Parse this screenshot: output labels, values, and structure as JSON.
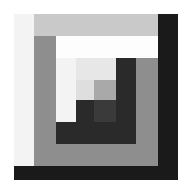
{
  "image": {
    "title": "Log Cabin Quilt Block",
    "type": "geometric-pattern",
    "canvas_width": 192,
    "canvas_height": 194,
    "background_color": "#ffffff"
  },
  "block": {
    "name": "log-cabin-block",
    "x": 14,
    "y": 14,
    "width": 164,
    "height": 166
  },
  "palette": {
    "background": "#ffffff",
    "white": "#fdfdfd",
    "near_white": "#f3f3f3",
    "light_gray": "#e7e7e7",
    "light_gray_2": "#dedede",
    "silver": "#c9c9c9",
    "medium_gray": "#a9a9a9",
    "gray": "#8e8e8e",
    "dark_gray": "#5c5c5c",
    "charcoal": "#3a3a3a",
    "near_black": "#2a2a2a",
    "black": "#1a1a1a"
  },
  "logs": [
    {
      "name": "log-ring1-left",
      "color": "#f3f3f3",
      "x": 0,
      "y": 0,
      "w": 20,
      "h": 152
    },
    {
      "name": "log-ring1-top",
      "color": "#c9c9c9",
      "x": 20,
      "y": 0,
      "w": 124,
      "h": 22
    },
    {
      "name": "log-ring1-right",
      "color": "#1a1a1a",
      "x": 144,
      "y": 0,
      "w": 20,
      "h": 152
    },
    {
      "name": "log-ring1-bottom",
      "color": "#1a1a1a",
      "x": 0,
      "y": 152,
      "w": 164,
      "h": 14
    },
    {
      "name": "log-ring2-left",
      "color": "#8e8e8e",
      "x": 20,
      "y": 22,
      "w": 22,
      "h": 108
    },
    {
      "name": "log-ring2-top",
      "color": "#fdfdfd",
      "x": 42,
      "y": 22,
      "w": 102,
      "h": 22
    },
    {
      "name": "log-ring2-right",
      "color": "#8e8e8e",
      "x": 122,
      "y": 44,
      "w": 22,
      "h": 108
    },
    {
      "name": "log-ring2-bottom",
      "color": "#8e8e8e",
      "x": 20,
      "y": 130,
      "w": 124,
      "h": 22
    },
    {
      "name": "log-ring3-left",
      "color": "#f3f3f3",
      "x": 42,
      "y": 44,
      "w": 20,
      "h": 64
    },
    {
      "name": "log-ring3-top",
      "color": "#e7e7e7",
      "x": 62,
      "y": 44,
      "w": 60,
      "h": 22
    },
    {
      "name": "log-ring3-right",
      "color": "#2a2a2a",
      "x": 102,
      "y": 44,
      "w": 20,
      "h": 86
    },
    {
      "name": "log-ring3-bottom",
      "color": "#2a2a2a",
      "x": 42,
      "y": 108,
      "w": 80,
      "h": 22
    },
    {
      "name": "log-ring4-left",
      "color": "#dedede",
      "x": 62,
      "y": 66,
      "w": 18,
      "h": 42
    },
    {
      "name": "log-ring4-top",
      "color": "#a9a9a9",
      "x": 80,
      "y": 66,
      "w": 22,
      "h": 20
    },
    {
      "name": "log-ring4-right",
      "color": "#3a3a3a",
      "x": 80,
      "y": 86,
      "w": 22,
      "h": 22
    },
    {
      "name": "log-ring4-bottom",
      "color": "#2a2a2a",
      "x": 62,
      "y": 86,
      "w": 18,
      "h": 22
    }
  ]
}
